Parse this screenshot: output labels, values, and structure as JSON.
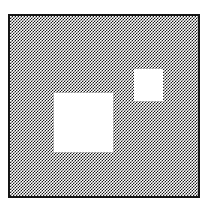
{
  "image": {
    "title": "Dithered square frame with two white cut-out squares",
    "kind": "monochrome-bitmap-graphic",
    "width": 208,
    "height": 205,
    "background_color": "#ffffff"
  },
  "frame": {
    "name": "outer-square-frame",
    "border_color": "#151515",
    "border_width_px": 2,
    "x": 8,
    "y": 14,
    "width": 192,
    "height": 184
  },
  "fill": {
    "name": "checkerboard-dither-fill",
    "pattern": "50% checkerboard",
    "dark_color": "#1a1a1a",
    "light_color": "#ffffff",
    "cell_size_px": 1.5,
    "apparent_tone": "#8f8f8f"
  },
  "shapes": [
    {
      "name": "knockout-large",
      "shape": "square",
      "color": "#ffffff",
      "x": 54,
      "y": 93,
      "width": 59,
      "height": 59
    },
    {
      "name": "knockout-small",
      "shape": "square",
      "color": "#ffffff",
      "x": 134,
      "y": 69,
      "width": 29,
      "height": 32
    }
  ]
}
